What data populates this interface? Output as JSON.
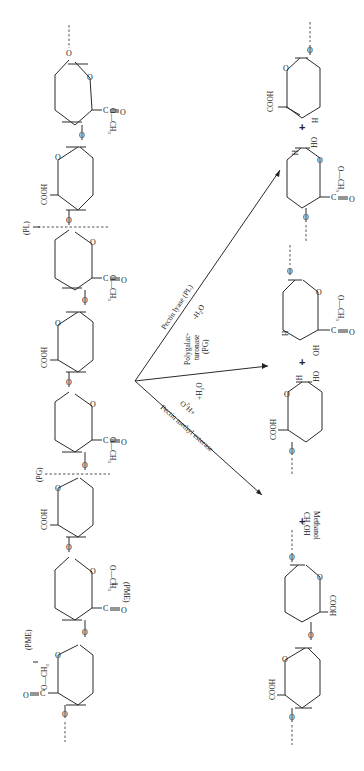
{
  "diagram": {
    "orientation": "rotated 90 degrees clockwise",
    "substrate_chain": {
      "units": [
        {
          "index": 0,
          "substituent_a": "C—O—CH3",
          "substituent_b": "=O",
          "type": "methyl-esterified"
        },
        {
          "index": 1,
          "substituent": "COOH",
          "type": "free-acid"
        },
        {
          "index": 2,
          "substituent_a": "C—O—CH3",
          "substituent_b": "=O",
          "type": "methyl-esterified"
        },
        {
          "index": 3,
          "substituent": "COOH",
          "type": "free-acid"
        },
        {
          "index": 4,
          "substituent_a": "C—O—CH3",
          "substituent_b": "=O",
          "type": "methyl-esterified"
        },
        {
          "index": 5,
          "substituent": "COOH",
          "type": "free-acid"
        },
        {
          "index": 6,
          "substituent_a": "C—O—CH3",
          "substituent_b": "=O",
          "type": "methyl-esterified"
        },
        {
          "index": 7,
          "substituent_a": "C—O—CH3",
          "substituent_b": "=O",
          "type": "methyl-esterified"
        }
      ],
      "ring_oxygen": "O",
      "linkage_oxygen": "O"
    },
    "cleavage_sites": [
      {
        "label": "(PL)",
        "enzyme": "Pectin lyase"
      },
      {
        "label": "(PG)",
        "enzyme": "Polygalacturonase"
      },
      {
        "label": "(PME)",
        "enzyme": "Pectin methyl esterase"
      },
      {
        "label": "(PME)",
        "enzyme": "Pectin methyl esterase"
      }
    ],
    "reactions": [
      {
        "enzyme_label": "Pectin lyase (PL)",
        "condition": "-H2O",
        "product_left_labels": [
          "H",
          "OH",
          "C—O—CH3",
          "=O",
          "O"
        ],
        "plus": "+",
        "product_right_labels": [
          "COOH",
          "H",
          "O"
        ]
      },
      {
        "enzyme_label_lines": [
          "Polygalac-",
          "turonase",
          "(PG)"
        ],
        "condition": "+H2O",
        "product_left_labels": [
          "H",
          "HO",
          "C—O—CH3",
          "=O",
          "O"
        ],
        "plus": "+",
        "product_right_labels": [
          "COOH",
          "H",
          "OH",
          "O"
        ]
      },
      {
        "enzyme_label": "Pectin methyl esterase",
        "condition": "+H2O",
        "byproduct": "CH3OH",
        "byproduct_name": "Methanol",
        "plus": "+",
        "product_labels": [
          "COOH",
          "COOH",
          "COOH"
        ]
      }
    ],
    "text": {
      "COOH": "COOH",
      "CH3": "CH",
      "sub3": "3",
      "O": "O",
      "C": "C",
      "H": "H",
      "OH": "OH",
      "HO": "HO",
      "PL": "(PL)",
      "PG": "(PG)",
      "PME": "(PME)",
      "pl_enzyme": "Pectin lyase (PL)",
      "pl_cond": "-H",
      "pg_line1": "Polygalac-",
      "pg_line2": "turonase",
      "pg_line3": "(PG)",
      "pg_cond": "+H",
      "pme_enzyme": "Pectin methyl esterase",
      "pme_cond": "+H",
      "h2o_2": "2",
      "h2o_O": "O",
      "methanol_formula": "CH",
      "methanol_oh": "OH",
      "methanol_name": "Methanol",
      "plus": "+"
    }
  }
}
